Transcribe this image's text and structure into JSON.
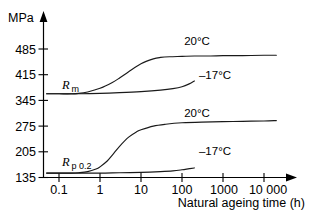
{
  "chart_data": {
    "type": "line",
    "title": "",
    "xlabel": "Natural ageing time (h)",
    "ylabel": "MPa",
    "xscale": "log",
    "xlim": [
      0.04,
      30000
    ],
    "ylim": [
      135,
      510
    ],
    "grid": false,
    "legend": "inline-annotations",
    "xticks": [
      "0.1",
      "1",
      "10",
      "100",
      "1000",
      "10 000"
    ],
    "xtick_values": [
      0.1,
      1,
      10,
      100,
      1000,
      10000
    ],
    "yticks": [
      "135",
      "205",
      "275",
      "345",
      "415",
      "485"
    ],
    "ytick_values": [
      135,
      205,
      275,
      345,
      415,
      485
    ],
    "group_labels": [
      {
        "id": "rm",
        "text_main": "R",
        "text_sub": "m",
        "full": "Rm"
      },
      {
        "id": "rp02",
        "text_main": "R",
        "text_sub": "p 0.2",
        "full": "Rp 0.2"
      }
    ],
    "series": [
      {
        "name": "Rm 20°C",
        "property": "Rm",
        "temperature": "20°C",
        "x": [
          0.05,
          0.1,
          0.2,
          0.3,
          0.5,
          1,
          2,
          3,
          5,
          10,
          20,
          30,
          50,
          100,
          200,
          500,
          1000,
          3000,
          10000,
          20000
        ],
        "y": [
          363,
          363,
          363,
          364,
          368,
          378,
          394,
          406,
          423,
          445,
          458,
          462,
          464,
          465,
          466,
          466,
          467,
          467,
          468,
          468
        ]
      },
      {
        "name": "Rm -17°C",
        "property": "Rm",
        "temperature": "-17°C",
        "x": [
          0.05,
          0.1,
          0.3,
          1,
          3,
          10,
          30,
          60,
          100,
          150,
          200
        ],
        "y": [
          363,
          363,
          363,
          364,
          366,
          369,
          373,
          377,
          382,
          390,
          398
        ]
      },
      {
        "name": "Rp0.2 20°C",
        "property": "Rp 0.2",
        "temperature": "20°C",
        "x": [
          0.05,
          0.1,
          0.2,
          0.3,
          0.5,
          0.8,
          1,
          1.5,
          2,
          3,
          5,
          8,
          10,
          20,
          40,
          100,
          300,
          1000,
          3000,
          10000,
          20000
        ],
        "y": [
          147,
          147,
          147,
          148,
          151,
          158,
          164,
          180,
          196,
          220,
          245,
          260,
          265,
          275,
          280,
          284,
          286,
          287,
          288,
          289,
          290
        ]
      },
      {
        "name": "Rp0.2 -17°C",
        "property": "Rp 0.2",
        "temperature": "-17°C",
        "x": [
          0.05,
          0.1,
          0.3,
          1,
          3,
          10,
          30,
          60,
          100,
          150,
          200
        ],
        "y": [
          147,
          147,
          147,
          147,
          148,
          149,
          151,
          153,
          156,
          159,
          161
        ]
      }
    ],
    "annotations": [
      {
        "id": "rm-20c",
        "text": "20°C",
        "x_px": 197,
        "y_px": 45
      },
      {
        "id": "rm-m17c",
        "text": "–17°C",
        "x_px": 212,
        "y_px": 79
      },
      {
        "id": "rp-20c",
        "text": "20°C",
        "x_px": 197,
        "y_px": 117
      },
      {
        "id": "rp-m17c",
        "text": "–17°C",
        "x_px": 212,
        "y_px": 155
      }
    ]
  },
  "colors": {
    "axis": "#000000",
    "curve": "#1a1a1a",
    "background": "#ffffff"
  }
}
